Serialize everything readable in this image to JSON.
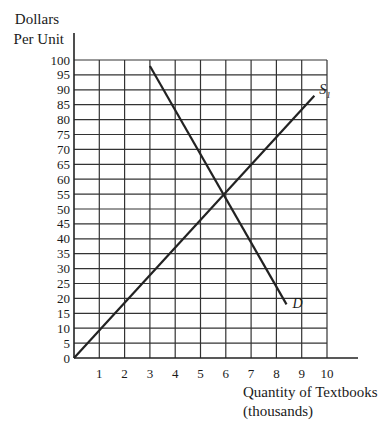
{
  "chart_data": {
    "type": "line",
    "title": "",
    "ylabel_lines": [
      "Dollars",
      "Per Unit"
    ],
    "xlabel_lines": [
      "Quantity of Textbooks",
      "(thousands)"
    ],
    "xlim": [
      0,
      10
    ],
    "ylim": [
      0,
      100
    ],
    "x_ticks": [
      1,
      2,
      3,
      4,
      5,
      6,
      7,
      8,
      9,
      10
    ],
    "y_ticks": [
      0,
      5,
      10,
      15,
      20,
      25,
      30,
      35,
      40,
      45,
      50,
      55,
      60,
      65,
      70,
      75,
      80,
      85,
      90,
      95,
      100
    ],
    "grid": true,
    "series": [
      {
        "name": "S1",
        "label": "S",
        "label_subscript": "1",
        "points": [
          [
            0,
            0
          ],
          [
            9.5,
            88
          ]
        ]
      },
      {
        "name": "D",
        "label": "D",
        "points": [
          [
            3,
            98
          ],
          [
            8.4,
            18
          ]
        ]
      }
    ],
    "equilibrium": {
      "x": 6,
      "y": 55
    }
  }
}
